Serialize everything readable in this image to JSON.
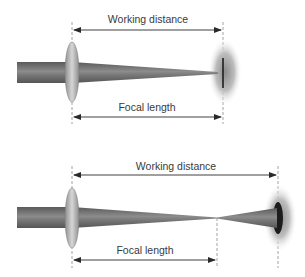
{
  "diagrams": [
    {
      "id": "top",
      "working_distance_label": "Working distance",
      "focal_length_label": "Focal length",
      "focus_position": "at target"
    },
    {
      "id": "bottom",
      "working_distance_label": "Working distance",
      "focal_length_label": "Focal length",
      "focus_position": "before target"
    }
  ],
  "colors": {
    "beam": "#6e6e6e",
    "beam_highlight": "#9a9a9a",
    "lens": "#b0b0b0",
    "glow": "#9a9a9a",
    "arrow": "#2a2a2a",
    "dash": "#8a8a8a"
  }
}
